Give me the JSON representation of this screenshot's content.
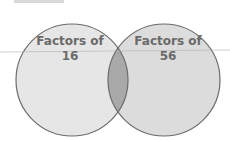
{
  "diagram": {
    "type": "venn",
    "top_text_cropped": "",
    "sets": [
      {
        "label_line1": "Factors of",
        "label_line2": "16"
      },
      {
        "label_line1": "Factors of",
        "label_line2": "56"
      }
    ],
    "colors": {
      "left_fill": "#e6e6e6",
      "right_fill": "#dcdcdc",
      "overlap_fill": "#a9a9a9",
      "stroke": "#6b6b6b",
      "text": "#6a6a6a"
    }
  }
}
